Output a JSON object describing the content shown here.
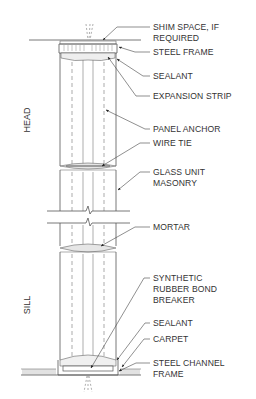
{
  "drawing": {
    "type": "section detail",
    "subject": "glass unit masonry panel head and sill",
    "side_labels": {
      "head": "HEAD",
      "sill": "SILL"
    },
    "callouts": [
      {
        "id": "shim-space",
        "lines": [
          "SHIM SPACE, IF",
          "REQUIRED"
        ]
      },
      {
        "id": "steel-frame",
        "lines": [
          "STEEL FRAME"
        ]
      },
      {
        "id": "sealant-top",
        "lines": [
          "SEALANT"
        ]
      },
      {
        "id": "expansion-strip",
        "lines": [
          "EXPANSION STRIP"
        ]
      },
      {
        "id": "panel-anchor",
        "lines": [
          "PANEL ANCHOR"
        ]
      },
      {
        "id": "wire-tie",
        "lines": [
          "WIRE TIE"
        ]
      },
      {
        "id": "glass-unit-masonry",
        "lines": [
          "GLASS UNIT",
          "MASONRY"
        ]
      },
      {
        "id": "mortar",
        "lines": [
          "MORTAR"
        ]
      },
      {
        "id": "bond-breaker",
        "lines": [
          "SYNTHETIC",
          "RUBBER BOND",
          "BREAKER"
        ]
      },
      {
        "id": "sealant-bottom",
        "lines": [
          "SEALANT"
        ]
      },
      {
        "id": "carpet",
        "lines": [
          "CARPET"
        ]
      },
      {
        "id": "steel-channel-frame",
        "lines": [
          "STEEL CHANNEL",
          "FRAME"
        ]
      }
    ]
  }
}
